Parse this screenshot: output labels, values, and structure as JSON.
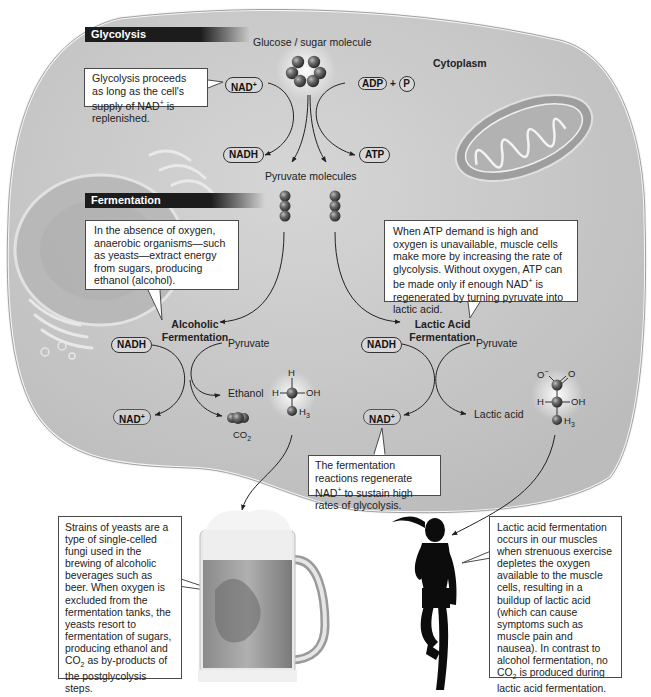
{
  "sections": {
    "glycolysis_header": "Glycolysis",
    "fermentation_header": "Fermentation"
  },
  "labels": {
    "glucose": "Glucose / sugar molecule",
    "cytoplasm": "Cytoplasm",
    "pyruvate_molecules": "Pyruvate molecules",
    "alcoholic_fermentation_line1": "Alcoholic",
    "alcoholic_fermentation_line2": "Fermentation",
    "lactic_fermentation_line1": "Lactic Acid",
    "lactic_fermentation_line2": "Fermentation",
    "pyruvate_left": "Pyruvate",
    "pyruvate_right": "Pyruvate",
    "ethanol": "Ethanol",
    "co2": "CO",
    "co2_sub": "2",
    "lactic_acid": "Lactic acid"
  },
  "molecule_tags": {
    "nad_plus_top": "NAD",
    "nadh_top": "NADH",
    "adp": "ADP",
    "plus": "+",
    "p": "P",
    "atp": "ATP",
    "nadh_left": "NADH",
    "nad_plus_left": "NAD",
    "nadh_right": "NADH",
    "nad_plus_right": "NAD",
    "plus_sup": "+"
  },
  "ethanol_structure": {
    "h_top": "H",
    "h_left": "H",
    "oh": "OH",
    "h3": "H",
    "h3_sub": "3"
  },
  "lactate_structure": {
    "o_minus": "O",
    "o_minus_sup": "−",
    "o": "O",
    "h_left": "H",
    "oh": "OH",
    "h3": "H",
    "h3_sub": "3"
  },
  "callouts": {
    "glycolysis_note": {
      "part1": "Glycolysis proceeds as long as the cell's supply of NAD",
      "sup": "+",
      "part2": " is replenished."
    },
    "alcoholic_note": "In the absence of oxygen, anaerobic organisms—such as yeasts—extract energy from sugars, producing ethanol (alcohol).",
    "lactic_note": {
      "part1": "When ATP demand is high and oxygen is unavailable, muscle cells make more by increasing the rate of glycolysis. Without oxygen, ATP can be made only if enough NAD",
      "sup": "+",
      "part2": " is regenerated by turning pyruvate into lactic acid."
    },
    "regenerate_note": {
      "part1": "The fermentation reactions regenerate NAD",
      "sup": "+",
      "part2": " to sustain high rates of glycolysis."
    },
    "yeast_note": {
      "part1": "Strains of yeasts are a type of single-celled fungi used in the brewing of alcoholic beverages such as beer. When oxygen is excluded from the fermentation tanks, the yeasts resort to fermentation of sugars, producing ethanol and CO",
      "sub": "2",
      "part2": " as by-products of the postglycolysis steps."
    },
    "muscle_note": {
      "part1": "Lactic acid fermentation occurs in our muscles when strenuous exercise depletes the oxygen available to the muscle cells, resulting in a buildup of lactic acid (which can cause symptoms such as muscle pain and nausea). In contrast to alcohol fermentation, no CO",
      "sub": "2",
      "part2": " is produced during lactic acid fermentation."
    }
  },
  "colors": {
    "cell_fill": "#c9c9c9",
    "header_bg": "#1c1c1c",
    "molecule_ball": "#555555",
    "callout_border": "#4a4a4a"
  }
}
